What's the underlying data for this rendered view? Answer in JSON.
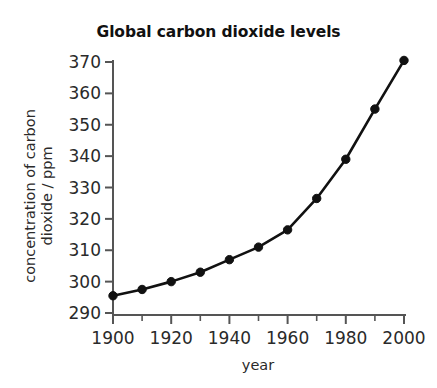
{
  "chart_data": {
    "type": "line",
    "title": "Global carbon dioxide levels",
    "xlabel": "year",
    "ylabel": "concentration of carbon dioxide / ppm",
    "ylabel_line1": "concentration of carbon",
    "ylabel_line2": "dioxide / ppm",
    "x": [
      1900,
      1910,
      1920,
      1930,
      1940,
      1950,
      1960,
      1970,
      1980,
      1990,
      2000
    ],
    "values": [
      295.5,
      297.5,
      300.0,
      303.0,
      307.0,
      311.0,
      316.5,
      326.5,
      339.0,
      355.0,
      370.5
    ],
    "xlim": [
      1900,
      2000
    ],
    "ylim": [
      290,
      370
    ],
    "x_ticks": [
      1900,
      1920,
      1940,
      1960,
      1980,
      2000
    ],
    "x_minor_ticks": [
      1910,
      1930,
      1950,
      1970,
      1990
    ],
    "y_ticks": [
      370,
      360,
      350,
      340,
      330,
      320,
      310,
      300,
      290
    ],
    "grid": false,
    "legend": false,
    "series_color": "#111111",
    "marker": "circle",
    "axis_color": "#555555"
  },
  "page": {
    "clipped_header_text": ""
  }
}
